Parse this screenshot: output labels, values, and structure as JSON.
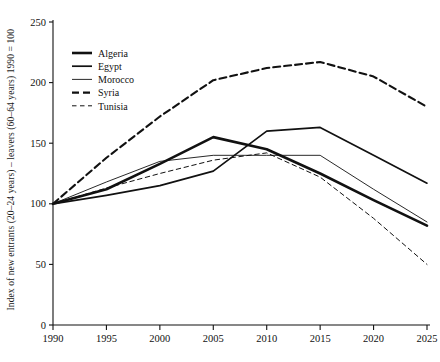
{
  "chart_data": {
    "type": "line",
    "title": "",
    "xlabel": "",
    "ylabel": "Index of new entrants (20–24 years) – leavers (60–64 years) 1990 = 100",
    "x": [
      1990,
      1995,
      2000,
      2005,
      2010,
      2015,
      2020,
      2025
    ],
    "xticklabels": [
      "1990",
      "1995",
      "2000",
      "2005",
      "2010",
      "2015",
      "2020",
      "2025"
    ],
    "yticks": [
      0,
      50,
      100,
      150,
      200,
      250
    ],
    "yticklabels": [
      "0",
      "50",
      "100",
      "150",
      "200",
      "250"
    ],
    "xlim": [
      1990,
      2025
    ],
    "ylim": [
      0,
      250
    ],
    "grid": false,
    "legend_position": "upper-left-inside",
    "series": [
      {
        "name": "Algeria",
        "style": "solid",
        "width": 2.6,
        "color": "#111111",
        "values": [
          100,
          112,
          133,
          155,
          145,
          125,
          103,
          82
        ]
      },
      {
        "name": "Egypt",
        "style": "solid",
        "width": 1.7,
        "color": "#111111",
        "values": [
          100,
          107,
          115,
          127,
          160,
          163,
          140,
          117
        ]
      },
      {
        "name": "Morocco",
        "style": "solid",
        "width": 0.9,
        "color": "#111111",
        "values": [
          100,
          118,
          135,
          140,
          140,
          140,
          112,
          85
        ]
      },
      {
        "name": "Syria",
        "style": "dashed",
        "width": 2.1,
        "color": "#111111",
        "values": [
          100,
          138,
          172,
          202,
          212,
          217,
          205,
          180
        ]
      },
      {
        "name": "Tunisia",
        "style": "dashed",
        "width": 1.0,
        "color": "#111111",
        "values": [
          100,
          113,
          125,
          136,
          142,
          122,
          88,
          50
        ]
      }
    ]
  }
}
